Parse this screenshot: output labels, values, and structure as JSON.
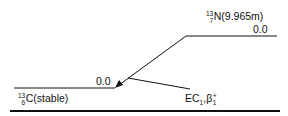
{
  "diagram": {
    "type": "nuclear decay scheme",
    "parent": {
      "mass_number": "13",
      "atomic_number": "7",
      "symbol": "N",
      "half_life": "(9.965m)",
      "level_energy": "0.0"
    },
    "daughter": {
      "mass_number": "13",
      "atomic_number": "6",
      "symbol": "C",
      "half_life": "(stable)",
      "level_energy": "0.0"
    },
    "transition": {
      "mode_ec": "EC",
      "mode_ec_sub": "1",
      "separator": ",",
      "mode_beta": "β",
      "mode_beta_sub": "1",
      "mode_beta_sup": "+"
    }
  },
  "colors": {
    "line": "#111111",
    "background": "#ffffff"
  }
}
